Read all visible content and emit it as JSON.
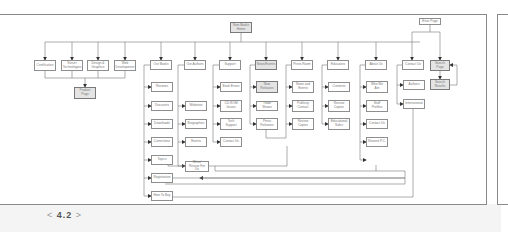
{
  "figure": {
    "page_number": "4.2",
    "prev_symbol": "<",
    "next_symbol": ">"
  },
  "nodes": {
    "home": "New Books\nHome",
    "error": "Error Page",
    "certification": "Certification",
    "server": "Server\nTechnologies",
    "design": "Design &\nGraphics",
    "webdev": "Web\nDevelopment",
    "product": "Product\nPage",
    "ourbooks": "Our Books",
    "ourauthors": "Our Authors",
    "support": "Support",
    "news": "News/Events",
    "press": "Press Room",
    "educators": "Educators",
    "about": "About Us",
    "contact": "Contact Us",
    "search": "Search\nPage",
    "results": "Search\nResults",
    "reviews": "Reviews",
    "discounts": "Discounts",
    "downloads": "Downloads",
    "corrections": "Corrections",
    "topics": "Topics",
    "registration": "Registration",
    "howtobuy": "How To Buy",
    "websites": "Websites",
    "biographies": "Biographies",
    "events": "Events",
    "writeforus": "Write/\nReview For Us",
    "bookerrors": "Book Errors",
    "cdrom": "CD-ROM\nIssues",
    "techsupport": "Tech\nSupport",
    "contactsupport": "Contact Us",
    "newreleases": "New\nReleases",
    "tradeshows": "Trade Shows",
    "pressreleases": "Press\nReleases",
    "newsevents2": "News and\nEvents",
    "publicity": "Publicity\nContact",
    "reviewcopies": "Review\nCopies",
    "contents": "Contents",
    "reviewcopies2": "Review\nCopies",
    "edsales": "Educational\nSales",
    "whoweare": "Who We\nAre",
    "staff": "Staff\nProfiles",
    "contactabout": "Contact Us",
    "nearestpc": "Nearest P.C.",
    "authors": "Authors",
    "international": "International"
  }
}
